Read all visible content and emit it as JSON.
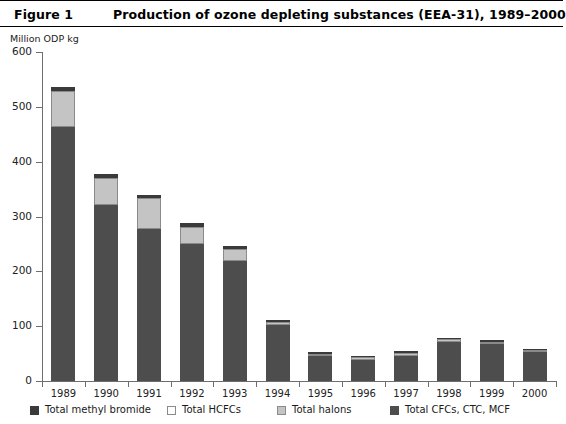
{
  "header": {
    "figure_number": "Figure 1",
    "title": "Production of ozone depleting substances (EEA-31), 1989–2000"
  },
  "chart_data": {
    "type": "bar",
    "subtype": "stacked-vertical",
    "title": "Production of ozone depleting substances (EEA-31), 1989–2000",
    "xlabel": "",
    "ylabel": "Million ODP kg",
    "ylim": [
      0,
      600
    ],
    "ytick_values": [
      0,
      100,
      200,
      300,
      400,
      500,
      600
    ],
    "ytick_labels": [
      "0",
      "100",
      "200",
      "300",
      "400",
      "500",
      "600"
    ],
    "grid": false,
    "legend_position": "bottom",
    "categories": [
      "1989",
      "1990",
      "1991",
      "1992",
      "1993",
      "1994",
      "1995",
      "1996",
      "1997",
      "1998",
      "1999",
      "2000"
    ],
    "series": [
      {
        "name": "Total CFCs, CTC, MCF",
        "color": "#4d4d4d",
        "values": [
          464,
          321,
          277,
          250,
          219,
          103,
          45,
          38,
          46,
          72,
          68,
          52
        ]
      },
      {
        "name": "Total halons",
        "color": "#c4c4c4",
        "values": [
          65,
          50,
          56,
          31,
          21,
          5,
          5,
          5,
          5,
          4,
          4,
          4
        ]
      },
      {
        "name": "Total HCFCs",
        "color": "#fdfdfd",
        "values": [
          0,
          0,
          0,
          0,
          0,
          0,
          0,
          0,
          0,
          0,
          0,
          0
        ]
      },
      {
        "name": "Total methyl bromide",
        "color": "#3a3a3a",
        "values": [
          7,
          7,
          7,
          7,
          6,
          3,
          3,
          2,
          3,
          3,
          3,
          3
        ]
      }
    ],
    "totals": [
      536,
      378,
      340,
      288,
      246,
      111,
      53,
      45,
      54,
      79,
      75,
      59
    ]
  },
  "legend": {
    "items": [
      {
        "label": "Total methyl bromide",
        "swatch": "sw-mebr"
      },
      {
        "label": "Total HCFCs",
        "swatch": "sw-hcfc"
      },
      {
        "label": "Total halons",
        "swatch": "sw-halon"
      },
      {
        "label": "Total CFCs, CTC, MCF",
        "swatch": "sw-cfc"
      }
    ]
  }
}
